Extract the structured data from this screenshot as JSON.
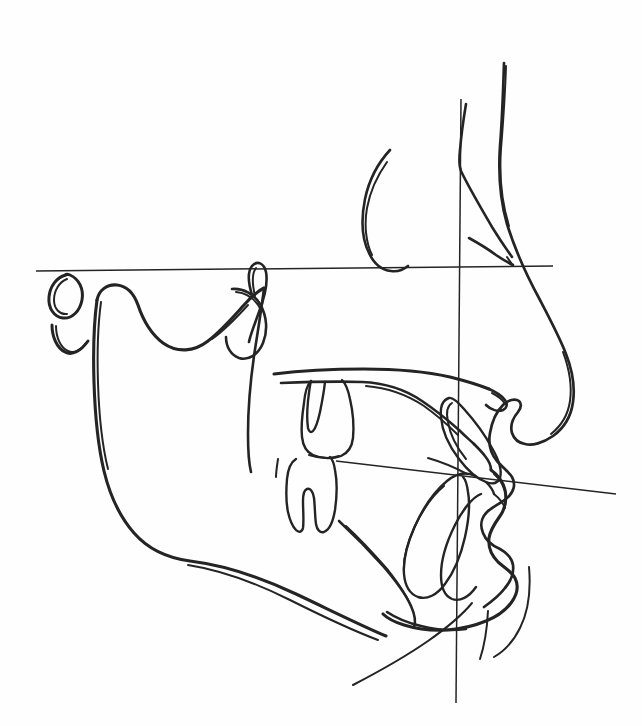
{
  "document": {
    "title": "Cephalometric Tracing",
    "type": "lateral-cephalometric-radiograph-tracing",
    "orientation": "profile facing right",
    "background_color": "#fefefe",
    "ink_color": "#141414",
    "width": 642,
    "height": 726
  },
  "reference_planes": [
    {
      "id": "frankfort-horizontal",
      "name": "Frankfort Horizontal Plane",
      "style": "thin straight line",
      "x1": 36,
      "y1": 271,
      "x2": 553,
      "y2": 266
    },
    {
      "id": "facial-vertical",
      "name": "True Vertical / Facial Reference Line",
      "style": "thin straight line",
      "x1": 461,
      "y1": 99,
      "x2": 456,
      "y2": 703
    },
    {
      "id": "occlusal-plane",
      "name": "Occlusal Plane",
      "style": "thin straight line",
      "x1": 336,
      "y1": 461,
      "x2": 616,
      "y2": 494
    }
  ],
  "anatomic_structures": [
    {
      "id": "soft-tissue-profile",
      "label": "Soft tissue facial profile (forehead, nasion, nose, lips, chin)"
    },
    {
      "id": "nasal-bone",
      "label": "Nasal bone / frontonasal suture"
    },
    {
      "id": "sella-turcica",
      "label": "Sella turcica"
    },
    {
      "id": "mandibular-ramus",
      "label": "Mandibular ramus and condyle"
    },
    {
      "id": "gonial-angle",
      "label": "Gonial angle"
    },
    {
      "id": "mandibular-body",
      "label": "Mandibular body and lower border"
    },
    {
      "id": "symphysis",
      "label": "Mandibular symphysis / pogonion"
    },
    {
      "id": "maxilla-palate",
      "label": "Maxilla and hard palate"
    },
    {
      "id": "upper-molar",
      "label": "Maxillary first molar"
    },
    {
      "id": "lower-molar",
      "label": "Mandibular first molar"
    },
    {
      "id": "upper-incisor",
      "label": "Maxillary central incisor"
    },
    {
      "id": "lower-incisor",
      "label": "Mandibular central incisor"
    },
    {
      "id": "pterygomaxillary-fissure",
      "label": "Pterygomaxillary fissure"
    },
    {
      "id": "porion-marker",
      "label": "Porion / ear-rod marker (oval)"
    },
    {
      "id": "orbitale-marker",
      "label": "Orbitale marker (V mark)"
    },
    {
      "id": "cervical-spine",
      "label": "Cervical vertebra outline"
    },
    {
      "id": "hyoid-arc",
      "label": "Hyoid / submental soft tissue arc"
    }
  ],
  "annotations": {
    "labels": [],
    "measurements": []
  }
}
